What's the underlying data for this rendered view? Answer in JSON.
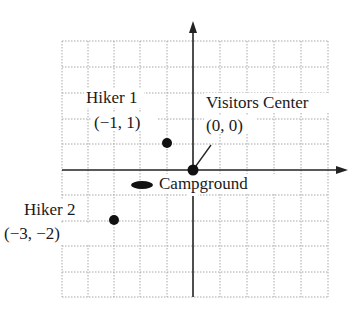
{
  "diagram": {
    "type": "coordinate-plane",
    "grid": {
      "x_range": [
        -5,
        5
      ],
      "y_range": [
        -5,
        5
      ],
      "style": "dotted",
      "color": "#9a9a9a"
    },
    "axes": {
      "color": "#222222",
      "arrows": [
        "positive-x",
        "positive-y"
      ]
    },
    "points": [
      {
        "name": "Hiker 1",
        "coord_label": "(−1, 1)",
        "x": -1,
        "y": 1
      },
      {
        "name": "Visitors Center",
        "coord_label": "(0, 0)",
        "x": 0,
        "y": 0
      },
      {
        "name": "Hiker 2",
        "coord_label": "(−3, −2)",
        "x": -3,
        "y": -2
      },
      {
        "name": "Campground",
        "coord_label": "",
        "x": -2,
        "y": -0.6
      }
    ]
  },
  "labels": {
    "hiker1_name": "Hiker 1",
    "hiker1_coord": "(−1, 1)",
    "visitors_name": "Visitors Center",
    "visitors_coord": "(0, 0)",
    "campground_name": "Campground",
    "hiker2_name": "Hiker 2",
    "hiker2_coord": "(−3, −2)"
  }
}
